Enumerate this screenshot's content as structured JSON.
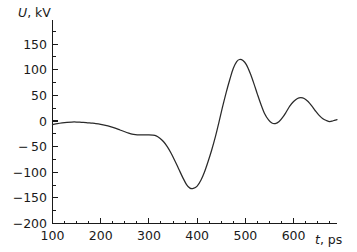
{
  "chart_data": {
    "type": "line",
    "title": "",
    "xlabel": "t, ps",
    "ylabel": "U, kV",
    "xlabel_var": "t",
    "xlabel_unit": ", ps",
    "ylabel_var": "U",
    "ylabel_unit": ", kV",
    "xlim": [
      100,
      690
    ],
    "ylim": [
      -200,
      175
    ],
    "grid": false,
    "legend": null,
    "line_color": "#2a2a2a",
    "background_color": "#ffffff",
    "axis_color": "#1a1a1a",
    "x_major_ticks": [
      100,
      200,
      300,
      400,
      500,
      600
    ],
    "x_major_tick_labels": [
      "100",
      "200",
      "300",
      "400",
      "500",
      "600"
    ],
    "x_minor_tick_step": 25,
    "y_major_ticks": [
      150,
      100,
      50,
      0,
      -50,
      -100,
      -150,
      -200
    ],
    "y_major_tick_labels": [
      "150",
      "100",
      "50",
      "0",
      "− 50",
      "−100",
      "−150",
      "−200"
    ],
    "y_minor_tick_step": 25,
    "series": [
      {
        "name": "U(t)",
        "x": [
          100,
          110,
          120,
          130,
          140,
          150,
          160,
          170,
          180,
          190,
          200,
          210,
          220,
          230,
          240,
          250,
          258,
          265,
          272,
          280,
          290,
          300,
          308,
          315,
          322,
          330,
          338,
          346,
          354,
          362,
          370,
          378,
          385,
          392,
          400,
          408,
          415,
          422,
          430,
          438,
          445,
          452,
          460,
          468,
          475,
          482,
          488,
          495,
          502,
          510,
          518,
          525,
          532,
          540,
          548,
          555,
          562,
          570,
          578,
          585,
          592,
          600,
          608,
          615,
          622,
          630,
          638,
          645,
          652,
          660,
          668,
          675,
          682,
          690
        ],
        "y": [
          -7,
          -5,
          -3.5,
          -2.5,
          -2,
          -2,
          -2.5,
          -3,
          -4,
          -5,
          -6.5,
          -8.5,
          -11,
          -14,
          -17.5,
          -21,
          -23.5,
          -25.5,
          -26.5,
          -27,
          -27,
          -27,
          -27.5,
          -29,
          -33,
          -40,
          -50,
          -63,
          -78,
          -94,
          -110,
          -124,
          -131,
          -131.5,
          -127,
          -115,
          -100,
          -81,
          -57,
          -30,
          -3,
          25,
          55,
          82,
          103,
          116,
          120,
          118,
          110,
          93,
          72,
          52,
          33,
          14,
          2,
          -4,
          -5,
          -1,
          8,
          18,
          29,
          38,
          44,
          45.5,
          44,
          38,
          29,
          20,
          12,
          5,
          1,
          -1,
          0.5,
          2.5
        ]
      }
    ],
    "annotations": {
      "global_minimum": {
        "x": 388,
        "y": -132
      },
      "global_maximum": {
        "x": 488,
        "y": 120
      },
      "secondary_maximum": {
        "x": 615,
        "y": 45.5
      }
    }
  }
}
